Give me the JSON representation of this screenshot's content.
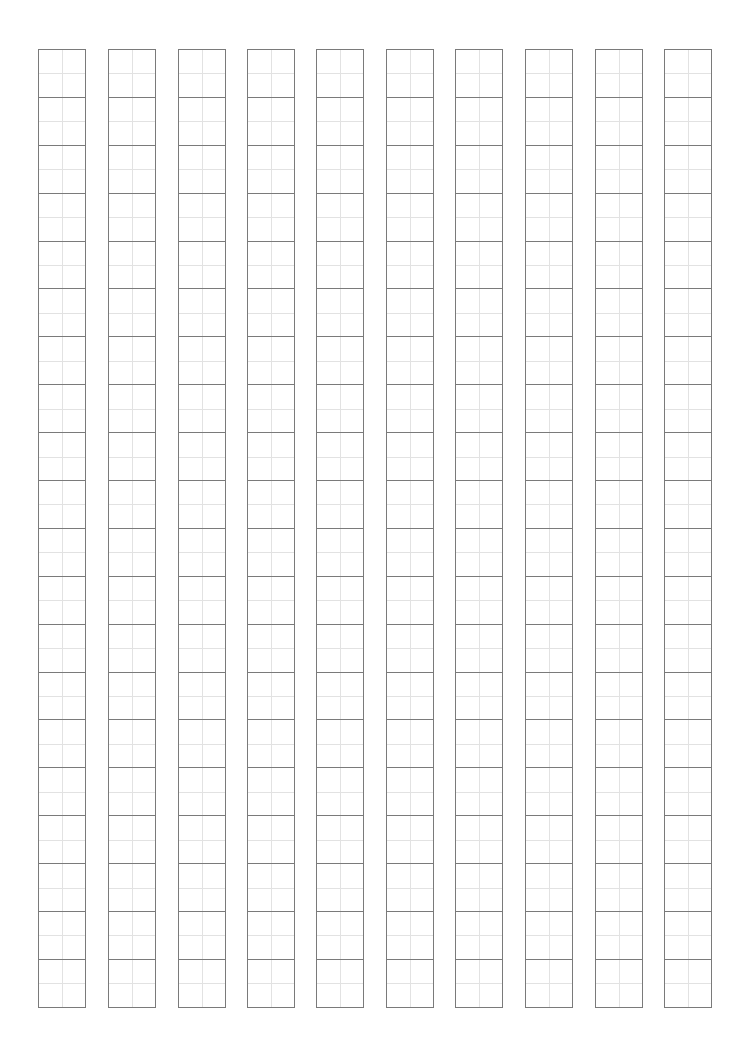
{
  "sheet": {
    "type": "tianzige-practice-grid",
    "columns": 10,
    "cells_per_column": 20,
    "column_left_positions": [
      38,
      108,
      178,
      247,
      316,
      386,
      455,
      525,
      595,
      664
    ],
    "top": 49,
    "bottom": 1007,
    "cell_width": 47,
    "line_color": "#7a7a7a",
    "guide_color": "#e2e2e2"
  }
}
